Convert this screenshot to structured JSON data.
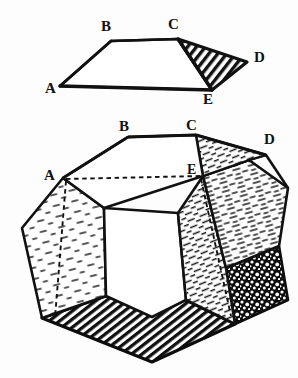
{
  "figure": {
    "title": "",
    "background_color": "#fdfdfd",
    "ink_color": "#111111",
    "upper_diagram": {
      "name": "trapezoid-with-shaded-triangle",
      "labels": [
        {
          "id": "A",
          "text": "A",
          "x": 48,
          "y": 92
        },
        {
          "id": "B",
          "text": "B",
          "x": 103,
          "y": 27
        },
        {
          "id": "C",
          "text": "C",
          "x": 169,
          "y": 25
        },
        {
          "id": "D",
          "text": "D",
          "x": 254,
          "y": 58
        },
        {
          "id": "E",
          "text": "E",
          "x": 205,
          "y": 101
        }
      ],
      "vertices": {
        "A": [
          60,
          86
        ],
        "B": [
          111,
          41
        ],
        "C": [
          178,
          39
        ],
        "D": [
          247,
          62
        ],
        "E": [
          212,
          90
        ]
      },
      "shaded_face": "C-D-E",
      "shading_style": "diagonal-hatch"
    },
    "lower_diagram": {
      "name": "dodecahedron-solid",
      "labels": [
        {
          "id": "A",
          "text": "A",
          "x": 48,
          "y": 178
        },
        {
          "id": "B",
          "text": "B",
          "x": 120,
          "y": 128
        },
        {
          "id": "C",
          "text": "C",
          "x": 186,
          "y": 128
        },
        {
          "id": "D",
          "text": "D",
          "x": 265,
          "y": 141
        },
        {
          "id": "E",
          "text": "E",
          "x": 190,
          "y": 174
        }
      ],
      "vertices": {
        "A": [
          63,
          178
        ],
        "B": [
          128,
          137
        ],
        "C": [
          196,
          135
        ],
        "D": [
          266,
          155
        ],
        "E": [
          203,
          176
        ]
      },
      "hidden_edges_style": "dashed",
      "faces": [
        {
          "id": "top-face",
          "shading": "none"
        },
        {
          "id": "upper-right-face",
          "shading": "fine-dash-hatch"
        },
        {
          "id": "right-face",
          "shading": "fine-dash-hatch"
        },
        {
          "id": "left-face",
          "shading": "sparse-dash-hatch"
        },
        {
          "id": "center-face",
          "shading": "none"
        },
        {
          "id": "center-right-face",
          "shading": "fine-dash-hatch"
        },
        {
          "id": "bottom-face",
          "shading": "dense-diagonal-hatch"
        },
        {
          "id": "lower-right-face",
          "shading": "stipple-dark"
        }
      ]
    }
  }
}
